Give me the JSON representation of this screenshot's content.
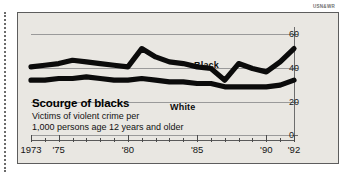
{
  "credit": "USN&WR",
  "headline": "Scourge of blacks",
  "subtitle_line1": "Victims of violent crime per",
  "subtitle_line2": "1,000 persons age 12 years and older",
  "series_labels": {
    "black": "Black",
    "white": "White"
  },
  "axis": {
    "y_ticks": [
      0,
      20,
      40,
      60
    ],
    "x_labels": [
      "1973",
      "'75",
      "'80",
      "'85",
      "'90",
      "'92"
    ],
    "x_label_years": [
      1973,
      1975,
      1980,
      1985,
      1990,
      1992
    ]
  },
  "colors": {
    "paper": "#e9e7e2",
    "ink": "#0b0b0b",
    "grid": "#9a9a9a",
    "frame": "#5d5d5d"
  },
  "chart_data": {
    "type": "line",
    "title": "Scourge of blacks",
    "subtitle": "Victims of violent crime per 1,000 persons age 12 years and older",
    "xlabel": "",
    "ylabel": "",
    "ylim": [
      0,
      65
    ],
    "xlim": [
      1973,
      1992
    ],
    "grid": true,
    "legend": "inline-labels",
    "x": [
      1973,
      1974,
      1975,
      1976,
      1977,
      1978,
      1979,
      1980,
      1981,
      1982,
      1983,
      1984,
      1985,
      1986,
      1987,
      1988,
      1989,
      1990,
      1991,
      1992
    ],
    "series": [
      {
        "name": "Black",
        "values": [
          41,
          42,
          43,
          45,
          44,
          43,
          42,
          41,
          52,
          47,
          44,
          43,
          41,
          40,
          33,
          43,
          40,
          38,
          44,
          52
        ]
      },
      {
        "name": "White",
        "values": [
          33,
          33,
          34,
          34,
          35,
          34,
          33,
          33,
          34,
          33,
          32,
          32,
          31,
          31,
          29,
          29,
          29,
          29,
          30,
          33
        ]
      }
    ]
  }
}
